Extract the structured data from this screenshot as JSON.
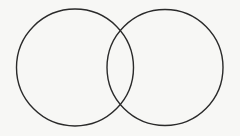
{
  "diagram": {
    "type": "venn",
    "width": 240,
    "height": 136,
    "background": "#f7f7f5",
    "stroke_color": "#2a2a2a",
    "stroke_width": 1.4,
    "circles": [
      {
        "id": "set-a",
        "cx": 75,
        "cy": 67.5,
        "r": 58.5
      },
      {
        "id": "set-b",
        "cx": 165,
        "cy": 67.5,
        "r": 58
      }
    ],
    "labels": []
  }
}
